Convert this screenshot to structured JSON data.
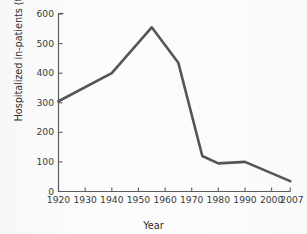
{
  "chart_data": {
    "type": "line",
    "title": "",
    "xlabel": "Year",
    "ylabel": "Hospitalized in-patients (thousands)",
    "xlim": [
      1920,
      2007
    ],
    "ylim": [
      0,
      600
    ],
    "grid": false,
    "legend": null,
    "xticks": [
      1920,
      1930,
      1940,
      1950,
      1960,
      1970,
      1980,
      1990,
      2000,
      2007
    ],
    "xtick_labels": [
      "1920",
      "1930",
      "1940",
      "1950",
      "1960",
      "1970",
      "1980",
      "1990",
      "2000",
      "2007"
    ],
    "yticks": [
      0,
      100,
      200,
      300,
      400,
      500,
      600
    ],
    "ytick_labels": [
      "0",
      "100",
      "200",
      "300",
      "400",
      "500",
      "600"
    ],
    "series": [
      {
        "name": "Hospitalized in-patients",
        "color": "#555557",
        "x": [
          1920,
          1940,
          1955,
          1965,
          1974,
          1980,
          1990,
          2007
        ],
        "values": [
          305,
          400,
          555,
          435,
          120,
          95,
          100,
          35
        ]
      }
    ]
  },
  "axes": {
    "line_color": "#5d5d5d",
    "data_color": "#555557",
    "background": "#fdfdfd"
  }
}
